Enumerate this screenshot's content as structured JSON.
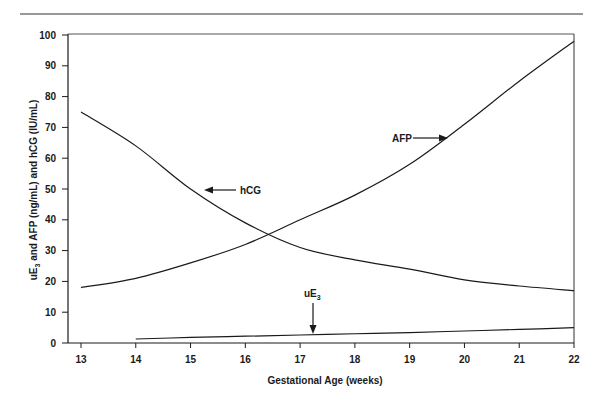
{
  "chart_data": {
    "type": "line",
    "title": "",
    "xlabel": "Gestational Age (weeks)",
    "ylabel": "uE3 and AFP (ng/mL) and hCG (IU/mL)",
    "xlim": [
      13,
      22
    ],
    "ylim": [
      0,
      100
    ],
    "x_ticks": [
      13,
      14,
      15,
      16,
      17,
      18,
      19,
      20,
      21,
      22
    ],
    "y_ticks": [
      0,
      10,
      20,
      30,
      40,
      50,
      60,
      70,
      80,
      90,
      100
    ],
    "grid": false,
    "legend": "none (inline annotations with arrows)",
    "series": [
      {
        "name": "hCG",
        "x": [
          13,
          14,
          15,
          16,
          17,
          18,
          19,
          20,
          21,
          22
        ],
        "values": [
          75,
          64,
          50,
          39,
          31,
          27,
          24,
          20.5,
          18.5,
          17
        ]
      },
      {
        "name": "AFP",
        "x": [
          13,
          14,
          15,
          16,
          17,
          18,
          19,
          20,
          21,
          22
        ],
        "values": [
          18,
          21,
          26,
          32,
          40,
          48,
          58,
          71,
          85,
          98
        ]
      },
      {
        "name": "uE3",
        "x": [
          14,
          15,
          16,
          17,
          18,
          19,
          20,
          21,
          22
        ],
        "values": [
          1.3,
          1.8,
          2.2,
          2.6,
          3.0,
          3.4,
          3.9,
          4.4,
          5.0
        ]
      }
    ],
    "annotations": [
      {
        "label": "hCG",
        "arrow_direction": "left",
        "near_x": 15.1,
        "near_y": 50
      },
      {
        "label": "AFP",
        "arrow_direction": "right",
        "near_x": 19.7,
        "near_y": 66
      },
      {
        "label": "uE3",
        "arrow_direction": "down",
        "near_x": 17.2,
        "near_y": 2.6
      }
    ]
  },
  "labels": {
    "xlabel": "Gestational Age (weeks)",
    "ylabel_prefix": "uE",
    "ylabel_sub": "3",
    "ylabel_rest": " and AFP (ng/mL) and hCG (IU/mL)",
    "hcg": "hCG",
    "afp": "AFP",
    "ue3_main": "uE",
    "ue3_sub": "3"
  },
  "colors": {
    "line": "#1a1a1a",
    "rule": "#333333"
  }
}
